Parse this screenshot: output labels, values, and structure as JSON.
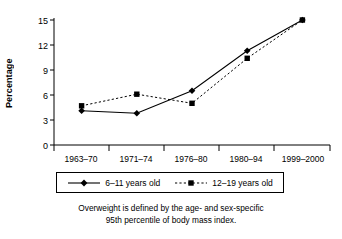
{
  "chart_data": {
    "type": "line",
    "title": "",
    "subtitle": "",
    "xlabel": "",
    "ylabel": "Percentage",
    "categories": [
      "1963–70",
      "1971–74",
      "1976–80",
      "1980–94",
      "1999–2000"
    ],
    "ylim": [
      0,
      15
    ],
    "yticks": [
      0,
      3,
      6,
      9,
      12,
      15
    ],
    "ytick_labels": [
      "0",
      "3",
      "6",
      "9",
      "12",
      "15"
    ],
    "grid": false,
    "legend_position": "below-axes",
    "series": [
      {
        "name": "6–11 years old",
        "values": [
          4.1,
          3.8,
          6.5,
          11.3,
          15.0
        ],
        "line_style": "solid",
        "marker": "diamond",
        "color": "#000000"
      },
      {
        "name": "12–19 years old",
        "values": [
          4.7,
          6.1,
          5.0,
          10.4,
          15.0
        ],
        "line_style": "dashed",
        "marker": "square",
        "color": "#000000"
      }
    ],
    "annotations": [
      "Overweight is defined by the age- and sex-specific",
      "95th percentile of body mass index."
    ]
  },
  "axis": {
    "y_label": "Percentage",
    "y_ticks": [
      "15",
      "12",
      "9",
      "6",
      "3",
      "0"
    ],
    "x_ticks": [
      "1963–70",
      "1971–74",
      "1976–80",
      "1980–94",
      "1999–2000"
    ]
  },
  "legend": {
    "items": [
      {
        "label": "6–11 years old",
        "marker": "diamond-marker",
        "style": "solid"
      },
      {
        "label": "12–19 years old",
        "marker": "square-marker",
        "style": "dashed"
      }
    ]
  },
  "caption": {
    "line1": "Overweight is defined by the age- and sex-specific",
    "line2": "95th percentile of body mass index."
  }
}
